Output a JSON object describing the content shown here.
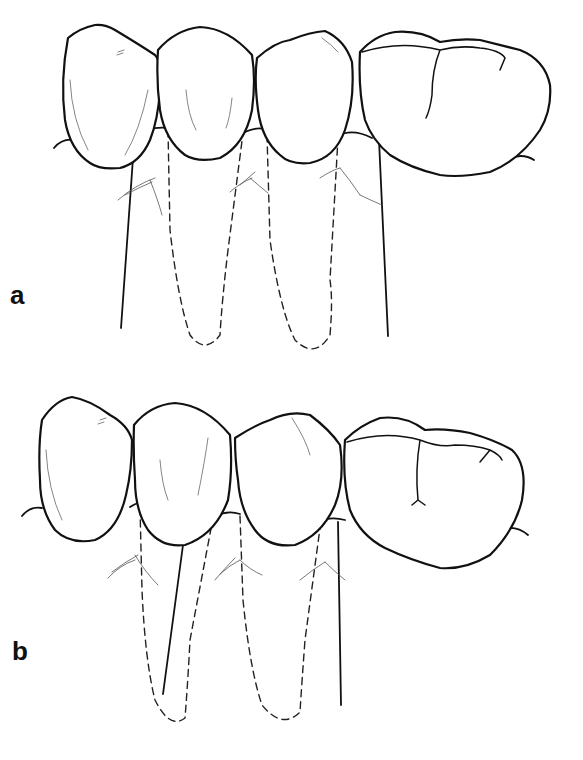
{
  "figure": {
    "panels": [
      {
        "label": "a",
        "teeth": [
          "premolar-left",
          "premolar-middle-1",
          "premolar-middle-2",
          "molar-right"
        ],
        "axis_lines": 2,
        "dashed_roots": 2
      },
      {
        "label": "b",
        "teeth": [
          "premolar-left",
          "premolar-middle-1",
          "premolar-middle-2",
          "molar-right"
        ],
        "axis_lines": 2,
        "dashed_roots": 2
      }
    ],
    "colors": {
      "line": "#111111",
      "background": "#ffffff"
    }
  }
}
